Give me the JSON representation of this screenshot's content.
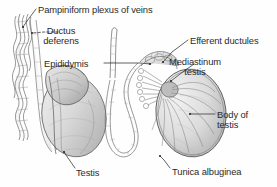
{
  "figure": {
    "style": "grayscale pencil-and-wash medical illustration",
    "background_color": "#fefefe",
    "ink_color": "#2b2b2b",
    "panel_count": 3
  },
  "panels": [
    {
      "id": "panel-left",
      "name": "intact-testis-lateral-view",
      "description": "Lateral view of testis with epididymis and spermatic cord vessels"
    },
    {
      "id": "panel-middle",
      "name": "unraveled-duct-system",
      "description": "Ductus deferens and uncoiled epididymal tubule"
    },
    {
      "id": "panel-right",
      "name": "sectioned-testis",
      "description": "Sagittal section of testis showing septa, mediastinum and efferent ductules"
    }
  ],
  "labels": [
    {
      "id": "pampiniform",
      "text": "Pampiniform plexus of veins",
      "align": "left",
      "x": 38,
      "y": 5,
      "lines": [
        "Pampiniform plexus of veins"
      ]
    },
    {
      "id": "ductus",
      "text": "Ductus deferens",
      "align": "center",
      "x": 61,
      "y": 26,
      "lines": [
        "Ductus",
        "deferens"
      ]
    },
    {
      "id": "epididymis",
      "text": "Epididymis",
      "align": "left",
      "x": 44,
      "y": 59,
      "lines": [
        "Epididymis"
      ]
    },
    {
      "id": "efferent",
      "text": "Efferent ductules",
      "align": "left",
      "x": 190,
      "y": 36,
      "lines": [
        "Efferent ductules"
      ]
    },
    {
      "id": "mediastinum",
      "text": "Mediastinum testis",
      "align": "center",
      "x": 195,
      "y": 57,
      "lines": [
        "Mediastinum",
        "testis"
      ]
    },
    {
      "id": "body",
      "text": "Body of testis",
      "align": "left",
      "x": 217,
      "y": 110,
      "lines": [
        "Body of",
        "testis"
      ]
    },
    {
      "id": "tunica",
      "text": "Tunica albuginea",
      "align": "left",
      "x": 172,
      "y": 167,
      "lines": [
        "Tunica albuginea"
      ]
    },
    {
      "id": "testis",
      "text": "Testis",
      "align": "left",
      "x": 76,
      "y": 168,
      "lines": [
        "Testis"
      ]
    }
  ],
  "leaders": [
    {
      "id": "leader-pampiniform",
      "from_label": "pampiniform",
      "style": "solid",
      "points": "36,9 27,21 23,27"
    },
    {
      "id": "leader-ductus",
      "from_label": "ductus",
      "style": "dashed",
      "points": "58,32 44,32 32,33"
    },
    {
      "id": "leader-epididymis",
      "from_label": "epididymis",
      "style": "solid",
      "points": "104,63 140,63 150,64"
    },
    {
      "id": "leader-efferent",
      "from_label": "efferent",
      "style": "solid",
      "points": "188,40 172,52 163,62"
    },
    {
      "id": "leader-mediastinum",
      "from_label": "mediastinum",
      "style": "solid",
      "points": "194,64 180,74 171,81"
    },
    {
      "id": "leader-body",
      "from_label": "body",
      "style": "solid",
      "points": "215,114 200,114 190,114"
    },
    {
      "id": "leader-tunica",
      "from_label": "tunica",
      "style": "solid",
      "points": "170,168 164,160 160,156"
    },
    {
      "id": "leader-testis",
      "from_label": "testis",
      "style": "solid",
      "points": "75,168 68,158 64,152"
    }
  ],
  "colors": {
    "ink": "#2b2b2b",
    "outline": "#555555",
    "tissue_light": "#e6e6e6",
    "tissue_mid": "#cfcfcf",
    "tissue_dark": "#a8a8a8",
    "shadow": "#8d8d8d",
    "background": "#fefefe"
  }
}
